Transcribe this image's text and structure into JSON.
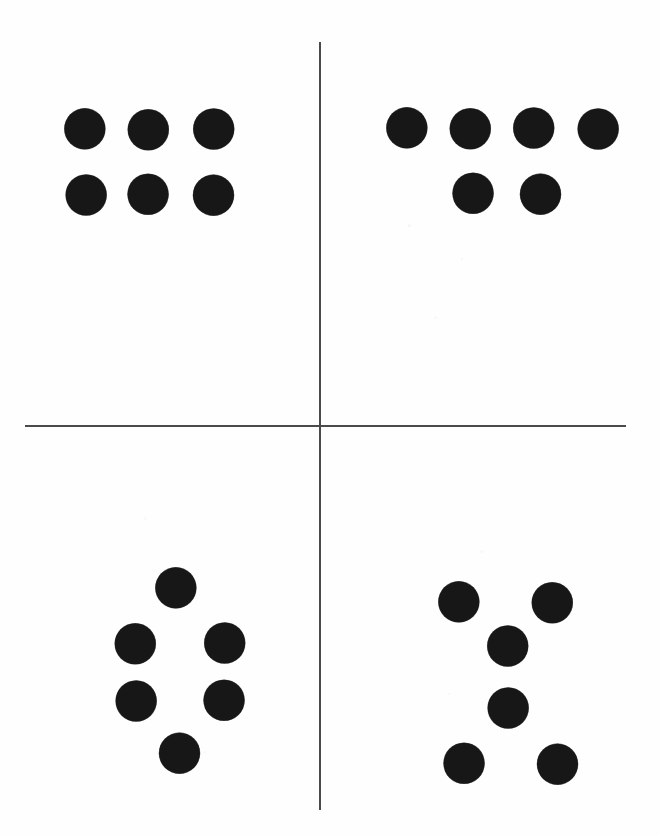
{
  "figure": {
    "canvas": {
      "width": 660,
      "height": 836
    },
    "background_color": "#fefefe",
    "dot_color": "#171717",
    "line_color": "#4a4a4a",
    "dot_diameter": 41
  },
  "dividers": {
    "vertical": {
      "x": 320,
      "y_start": 42,
      "y_end": 810,
      "thickness": 1.6
    },
    "horizontal": {
      "y": 426,
      "x_start": 25,
      "x_end": 626,
      "thickness": 1.6
    }
  },
  "chart_data": {
    "type": "scatter",
    "xlabel": "",
    "ylabel": "",
    "xlim": [
      0,
      660
    ],
    "ylim": [
      836,
      0
    ],
    "grid": false,
    "legend": "none",
    "annotations": [],
    "series": [
      {
        "name": "top-left-pattern",
        "description": "3 x 2 rectangular grid of six dots",
        "count": 6,
        "points": [
          {
            "x": 85,
            "y": 129
          },
          {
            "x": 148,
            "y": 129
          },
          {
            "x": 213,
            "y": 129
          },
          {
            "x": 85,
            "y": 194
          },
          {
            "x": 148,
            "y": 194
          },
          {
            "x": 213,
            "y": 194
          }
        ]
      },
      {
        "name": "top-right-pattern",
        "description": "Row of four dots above a row of two centered dots",
        "count": 6,
        "points": [
          {
            "x": 407,
            "y": 128
          },
          {
            "x": 470,
            "y": 128
          },
          {
            "x": 533,
            "y": 128
          },
          {
            "x": 597,
            "y": 128
          },
          {
            "x": 473,
            "y": 193
          },
          {
            "x": 540,
            "y": 193
          }
        ]
      },
      {
        "name": "bottom-left-pattern",
        "description": "Hexagonal ring of six dots: one top, two upper-middle, two lower-middle, one bottom",
        "count": 6,
        "points": [
          {
            "x": 176,
            "y": 588
          },
          {
            "x": 135,
            "y": 643
          },
          {
            "x": 224,
            "y": 643
          },
          {
            "x": 135,
            "y": 700
          },
          {
            "x": 224,
            "y": 700
          },
          {
            "x": 179,
            "y": 752
          }
        ]
      },
      {
        "name": "bottom-right-pattern",
        "description": "Hourglass of six dots: two top corners, two stacked centre dots, two bottom corners",
        "count": 6,
        "points": [
          {
            "x": 459,
            "y": 602
          },
          {
            "x": 552,
            "y": 602
          },
          {
            "x": 507,
            "y": 646
          },
          {
            "x": 507,
            "y": 707
          },
          {
            "x": 464,
            "y": 763
          },
          {
            "x": 557,
            "y": 763
          }
        ]
      }
    ]
  }
}
